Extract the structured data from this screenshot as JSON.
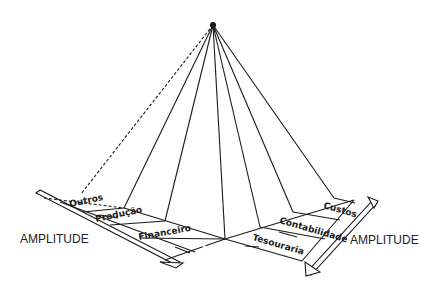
{
  "diagram": {
    "type": "pyramid-perspective",
    "left_axis_label": "AMPLITUDE",
    "right_axis_label": "AMPLITUDE",
    "left_areas": [
      "Outros",
      "Produção",
      "Financeiro"
    ],
    "right_areas": [
      "Custos",
      "Contabilidade",
      "Tesouraria"
    ],
    "colors": {
      "line": "#1a1a1a",
      "background": "#ffffff"
    }
  }
}
